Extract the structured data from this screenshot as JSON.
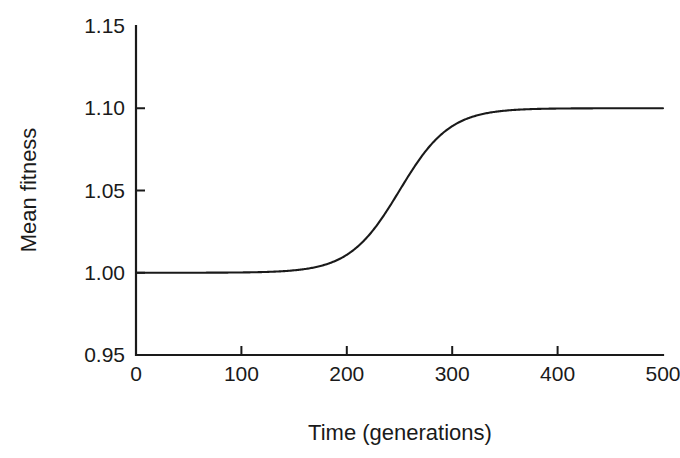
{
  "figure": {
    "background_color": "#ffffff",
    "ink_color": "#1a1a1a"
  },
  "chart_data": {
    "type": "line",
    "title": "",
    "xlabel": "Time (generations)",
    "ylabel": "Mean fitness",
    "xlim": [
      0,
      500
    ],
    "ylim": [
      0.95,
      1.15
    ],
    "xticks": [
      0,
      100,
      200,
      300,
      400,
      500
    ],
    "yticks": [
      0.95,
      1.0,
      1.05,
      1.1,
      1.15
    ],
    "xtick_labels": [
      "0",
      "100",
      "200",
      "300",
      "400",
      "500"
    ],
    "ytick_labels": [
      "0.95",
      "1.00",
      "1.05",
      "1.10",
      "1.15"
    ],
    "grid": false,
    "legend": false,
    "legend_position": "none",
    "series": [
      {
        "name": "Mean fitness",
        "color": "#1a1a1a",
        "description": "Logistic (sigmoid) increase from 1.00 to 1.10 with midpoint near generation 250",
        "baseline": 1.0,
        "plateau": 1.1,
        "midpoint": 250,
        "steepness": 0.042,
        "x": [
          0,
          25,
          50,
          75,
          100,
          125,
          150,
          175,
          190,
          200,
          210,
          220,
          230,
          240,
          250,
          260,
          270,
          280,
          290,
          300,
          310,
          320,
          340,
          360,
          380,
          400,
          425,
          450,
          475,
          500
        ],
        "y": [
          1.0,
          1.0,
          1.0,
          1.0,
          1.0,
          1.0,
          1.0,
          1.0005,
          1.0009,
          1.0014,
          1.0021,
          1.0033,
          1.0051,
          1.0078,
          1.0118,
          1.0174,
          1.0247,
          1.0334,
          1.0427,
          1.0515,
          1.0592,
          1.0654,
          1.0738,
          1.0785,
          1.0809,
          1.0821,
          1.0828,
          1.0831,
          1.0832,
          1.0833
        ]
      }
    ]
  },
  "axis_geometry": {
    "plot_left": 136,
    "plot_right": 663,
    "plot_top": 26,
    "plot_bottom": 355
  }
}
